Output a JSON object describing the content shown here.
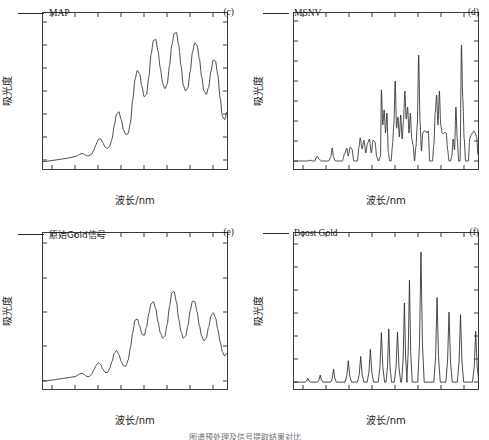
{
  "figure": {
    "axis_x_label": "波长/nm",
    "axis_y_label": "吸光度",
    "caption": "图谱预处理及信号提取结果对比"
  },
  "panels": [
    {
      "tag": "(c)",
      "legend": "MAP",
      "legend_is_cjk": false
    },
    {
      "tag": "(d)",
      "legend": "MSNV",
      "legend_is_cjk": false
    },
    {
      "tag": "(e)",
      "legend": "原始Gold信号",
      "legend_is_cjk": true
    },
    {
      "tag": "(f)",
      "legend": "Boost Gold",
      "legend_is_cjk": false
    }
  ],
  "chart_data": [
    {
      "type": "line",
      "panel": "c",
      "title": "MAP",
      "xlabel": "波长/nm",
      "ylabel": "吸光度",
      "xlim": [
        380,
        780
      ],
      "ylim": [
        -0.04,
        0.64
      ],
      "xticks": [
        400,
        450,
        500,
        550,
        600,
        650,
        700,
        750
      ],
      "yticks": [
        0,
        0.1,
        0.2,
        0.3,
        0.4,
        0.5,
        0.6
      ],
      "ytick_labels": [
        "0",
        "0.1",
        "0.2",
        "0.3",
        "0.4",
        "0.5",
        "0.6"
      ],
      "grid": false,
      "legend_position": "top-left",
      "x": [
        380,
        390,
        400,
        410,
        420,
        430,
        440,
        450,
        455,
        460,
        465,
        470,
        475,
        480,
        485,
        490,
        495,
        500,
        505,
        510,
        515,
        520,
        525,
        530,
        535,
        540,
        545,
        550,
        555,
        560,
        565,
        570,
        575,
        580,
        585,
        590,
        595,
        600,
        605,
        610,
        615,
        620,
        625,
        630,
        635,
        640,
        645,
        650,
        655,
        660,
        665,
        670,
        675,
        680,
        685,
        690,
        695,
        700,
        705,
        710,
        715,
        720,
        725,
        730,
        735,
        740,
        745,
        750,
        755,
        760,
        765,
        770,
        775,
        780
      ],
      "values": [
        -0.008,
        -0.006,
        -0.003,
        0.0,
        0.003,
        0.006,
        0.01,
        0.014,
        0.018,
        0.024,
        0.028,
        0.024,
        0.018,
        0.017,
        0.023,
        0.04,
        0.065,
        0.088,
        0.092,
        0.075,
        0.055,
        0.05,
        0.06,
        0.09,
        0.15,
        0.2,
        0.21,
        0.175,
        0.13,
        0.11,
        0.115,
        0.16,
        0.26,
        0.35,
        0.39,
        0.375,
        0.32,
        0.275,
        0.285,
        0.36,
        0.46,
        0.52,
        0.525,
        0.475,
        0.4,
        0.335,
        0.31,
        0.33,
        0.41,
        0.5,
        0.55,
        0.555,
        0.5,
        0.41,
        0.325,
        0.3,
        0.315,
        0.385,
        0.47,
        0.51,
        0.5,
        0.44,
        0.36,
        0.3,
        0.285,
        0.315,
        0.385,
        0.435,
        0.43,
        0.37,
        0.27,
        0.19,
        0.175,
        0.21,
        0.27,
        0.275,
        0.21,
        0.07
      ]
    },
    {
      "type": "line",
      "panel": "d",
      "title": "MSNV",
      "xlabel": "波长/nm",
      "ylabel": "吸光度",
      "xlim": [
        380,
        780
      ],
      "ylim": [
        -0.02,
        0.37
      ],
      "xticks": [
        400,
        450,
        500,
        550,
        600,
        650,
        700,
        750
      ],
      "yticks": [
        0,
        0.05,
        0.1,
        0.15,
        0.2,
        0.25,
        0.3,
        0.35
      ],
      "ytick_labels": [
        "0",
        "0.05",
        "0.10",
        "0.15",
        "0.20",
        "0.25",
        "0.30",
        "0.35"
      ],
      "grid": false,
      "legend_position": "top-left",
      "x": [
        380,
        385,
        390,
        395,
        400,
        405,
        410,
        415,
        420,
        425,
        430,
        435,
        440,
        445,
        450,
        455,
        460,
        463,
        466,
        470,
        475,
        480,
        485,
        490,
        495,
        498,
        502,
        506,
        510,
        514,
        518,
        521,
        524,
        528,
        532,
        536,
        540,
        544,
        548,
        552,
        556,
        560,
        564,
        568,
        570,
        573,
        576,
        579,
        582,
        585,
        588,
        591,
        594,
        597,
        600,
        603,
        606,
        609,
        612,
        615,
        618,
        621,
        624,
        627,
        630,
        633,
        636,
        639,
        642,
        645,
        648,
        651,
        654,
        657,
        660,
        663,
        666,
        669,
        672,
        675,
        678,
        681,
        684,
        687,
        690,
        693,
        696,
        699,
        702,
        705,
        708,
        711,
        714,
        717,
        720,
        723,
        726,
        729,
        732,
        735,
        738,
        741,
        744,
        747,
        750,
        753,
        756,
        759,
        762,
        765,
        768,
        771,
        774,
        777,
        780
      ],
      "values": [
        0.0,
        0.0,
        0.0,
        0.0,
        0.0,
        0.0,
        0.0,
        0.002,
        0.0,
        0.0,
        0.012,
        0.004,
        0.0,
        0.0,
        0.0,
        0.0,
        0.01,
        0.033,
        0.01,
        0.0,
        0.0,
        0.0,
        0.0,
        0.018,
        0.032,
        0.012,
        0.035,
        0.03,
        0.0,
        0.0,
        0.0,
        0.033,
        0.058,
        0.03,
        0.052,
        0.02,
        0.045,
        0.055,
        0.02,
        0.052,
        0.048,
        0.01,
        0.0,
        0.012,
        0.178,
        0.09,
        0.128,
        0.07,
        0.12,
        0.022,
        0.0,
        0.0,
        0.038,
        0.09,
        0.2,
        0.082,
        0.11,
        0.06,
        0.115,
        0.055,
        0.1,
        0.175,
        0.105,
        0.135,
        0.07,
        0.12,
        0.055,
        0.04,
        0.0,
        0.035,
        0.09,
        0.265,
        0.1,
        0.025,
        0.07,
        0.075,
        0.075,
        0.07,
        0.075,
        0.0,
        0.0,
        0.0,
        0.04,
        0.12,
        0.165,
        0.09,
        0.175,
        0.09,
        0.07,
        0.068,
        0.072,
        0.07,
        0.028,
        0.0,
        0.0,
        0.012,
        0.055,
        0.028,
        0.135,
        0.055,
        0.0,
        0.0,
        0.29,
        0.155,
        0.055,
        0.0,
        0.0,
        0.0,
        0.055,
        0.065,
        0.07,
        0.075,
        0.07,
        0.06,
        0.015
      ]
    },
    {
      "type": "line",
      "panel": "e",
      "title": "原始Gold信号",
      "xlabel": "波长/nm",
      "ylabel": "吸光度",
      "xlim": [
        380,
        780
      ],
      "ylim": [
        -0.012,
        0.215
      ],
      "xticks": [
        400,
        450,
        500,
        550,
        600,
        650,
        700,
        750
      ],
      "yticks": [
        0,
        0.05,
        0.1,
        0.15,
        0.2
      ],
      "ytick_labels": [
        "0",
        "0.05",
        "0.10",
        "0.15",
        "0.20"
      ],
      "grid": false,
      "legend_position": "top-left",
      "x": [
        380,
        390,
        400,
        410,
        420,
        430,
        440,
        450,
        455,
        460,
        465,
        470,
        475,
        480,
        485,
        490,
        495,
        500,
        505,
        510,
        515,
        520,
        525,
        530,
        535,
        540,
        545,
        550,
        555,
        560,
        565,
        570,
        575,
        580,
        585,
        590,
        595,
        600,
        605,
        610,
        615,
        620,
        625,
        630,
        635,
        640,
        645,
        650,
        655,
        660,
        665,
        670,
        675,
        680,
        685,
        690,
        695,
        700,
        705,
        710,
        715,
        720,
        725,
        730,
        735,
        740,
        745,
        750,
        755,
        760,
        765,
        770,
        775,
        780
      ],
      "values": [
        0.0,
        0.0,
        0.001,
        0.002,
        0.003,
        0.004,
        0.005,
        0.006,
        0.008,
        0.01,
        0.011,
        0.009,
        0.006,
        0.006,
        0.009,
        0.015,
        0.022,
        0.026,
        0.024,
        0.017,
        0.012,
        0.012,
        0.018,
        0.028,
        0.04,
        0.044,
        0.038,
        0.028,
        0.022,
        0.021,
        0.03,
        0.048,
        0.07,
        0.088,
        0.09,
        0.08,
        0.068,
        0.066,
        0.078,
        0.098,
        0.112,
        0.115,
        0.105,
        0.086,
        0.07,
        0.062,
        0.065,
        0.082,
        0.108,
        0.128,
        0.13,
        0.115,
        0.09,
        0.072,
        0.062,
        0.065,
        0.08,
        0.102,
        0.116,
        0.115,
        0.1,
        0.08,
        0.065,
        0.058,
        0.062,
        0.078,
        0.094,
        0.099,
        0.092,
        0.075,
        0.057,
        0.042,
        0.036,
        0.04,
        0.048,
        0.05,
        0.045,
        0.032
      ]
    },
    {
      "type": "line",
      "panel": "f",
      "title": "Boost Gold",
      "xlabel": "波长/nm",
      "ylabel": "吸光度",
      "xlim": [
        380,
        780
      ],
      "ylim": [
        -0.03,
        0.65
      ],
      "xticks": [
        400,
        450,
        500,
        550,
        600,
        650,
        700,
        750
      ],
      "yticks": [
        0,
        0.1,
        0.2,
        0.3,
        0.4,
        0.5,
        0.6
      ],
      "ytick_labels": [
        "0",
        "0.1",
        "0.2",
        "0.3",
        "0.4",
        "0.5",
        "0.6"
      ],
      "grid": false,
      "legend_position": "top-left",
      "peaks": [
        {
          "center": 410,
          "height": 0.016,
          "halfwidth": 6
        },
        {
          "center": 437,
          "height": 0.031,
          "halfwidth": 6
        },
        {
          "center": 466,
          "height": 0.057,
          "halfwidth": 6
        },
        {
          "center": 498,
          "height": 0.093,
          "halfwidth": 7
        },
        {
          "center": 525,
          "height": 0.112,
          "halfwidth": 7
        },
        {
          "center": 546,
          "height": 0.143,
          "halfwidth": 7
        },
        {
          "center": 570,
          "height": 0.216,
          "halfwidth": 7
        },
        {
          "center": 586,
          "height": 0.232,
          "halfwidth": 6
        },
        {
          "center": 605,
          "height": 0.219,
          "halfwidth": 7
        },
        {
          "center": 620,
          "height": 0.345,
          "halfwidth": 6
        },
        {
          "center": 631,
          "height": 0.445,
          "halfwidth": 6
        },
        {
          "center": 656,
          "height": 0.567,
          "halfwidth": 7
        },
        {
          "center": 691,
          "height": 0.369,
          "halfwidth": 7
        },
        {
          "center": 717,
          "height": 0.305,
          "halfwidth": 7
        },
        {
          "center": 742,
          "height": 0.294,
          "halfwidth": 7
        },
        {
          "center": 775,
          "height": 0.222,
          "halfwidth": 7
        }
      ]
    }
  ]
}
